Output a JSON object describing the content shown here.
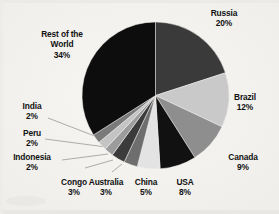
{
  "chart_data": {
    "type": "pie",
    "title": "",
    "subtitle": "",
    "xlabel": "",
    "ylabel": "",
    "legend_position": "none",
    "grid": false,
    "units": "percent",
    "total": 100,
    "start_angle_deg": 0,
    "direction": "clockwise",
    "categories": [
      "Russia",
      "Brazil",
      "Canada",
      "USA",
      "China",
      "Australia",
      "Congo",
      "Indonesia",
      "Peru",
      "India",
      "Rest of the World"
    ],
    "values": [
      20,
      12,
      9,
      8,
      5,
      3,
      3,
      2,
      2,
      2,
      34
    ],
    "slices": [
      {
        "label": "Russia",
        "value": 20,
        "value_text": "20%",
        "color": "#3a3a3a"
      },
      {
        "label": "Brazil",
        "value": 12,
        "value_text": "12%",
        "color": "#c9c9c9"
      },
      {
        "label": "Canada",
        "value": 9,
        "value_text": "9%",
        "color": "#8e8e8e"
      },
      {
        "label": "USA",
        "value": 8,
        "value_text": "8%",
        "color": "#111111"
      },
      {
        "label": "China",
        "value": 5,
        "value_text": "5%",
        "color": "#e3e3e3"
      },
      {
        "label": "Australia",
        "value": 3,
        "value_text": "3%",
        "color": "#6e6e6e"
      },
      {
        "label": "Congo",
        "value": 3,
        "value_text": "3%",
        "color": "#3b3b3b"
      },
      {
        "label": "Indonesia",
        "value": 2,
        "value_text": "2%",
        "color": "#9c9c9c"
      },
      {
        "label": "Peru",
        "value": 2,
        "value_text": "2%",
        "color": "#c4c4c4"
      },
      {
        "label": "India",
        "value": 2,
        "value_text": "2%",
        "color": "#7a7a7a"
      },
      {
        "label": "Rest of the World",
        "value": 34,
        "value_text": "34%",
        "color": "#0d0d0d"
      }
    ]
  },
  "labels": {
    "russia": {
      "name": "Russia",
      "value": "20%"
    },
    "brazil": {
      "name": "Brazil",
      "value": "12%"
    },
    "canada": {
      "name": "Canada",
      "value": "9%"
    },
    "usa": {
      "name": "USA",
      "value": "8%"
    },
    "china": {
      "name": "China",
      "value": "5%"
    },
    "australia": {
      "name": "Australia",
      "value": "3%"
    },
    "congo": {
      "name": "Congo",
      "value": "3%"
    },
    "indonesia": {
      "name": "Indonesia",
      "value": "2%"
    },
    "peru": {
      "name": "Peru",
      "value": "2%"
    },
    "india": {
      "name": "India",
      "value": "2%"
    },
    "rest": {
      "name_line1": "Rest of the",
      "name_line2": "World",
      "value": "34%"
    }
  },
  "colors": {
    "background": "#f4f3f1",
    "text": "#121212",
    "leader_line": "#8a8a8a",
    "slice_outline": "#f4f3f1"
  }
}
